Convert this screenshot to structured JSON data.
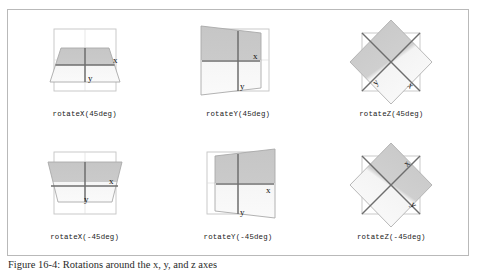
{
  "figure": {
    "caption": "Figure 16-4: Rotations around the x, y, and z axes",
    "frame_border_color": "#b9b9b9",
    "background_color": "#ffffff"
  },
  "colors": {
    "reference_outline": "#bfbfbf",
    "plane_outline": "#a8a8a8",
    "axis_line": "#6e6e6e",
    "plane_fill_dark": "#c9c9c9",
    "plane_fill_light": "#f2f2f2",
    "label_text": "#111111"
  },
  "axis_labels": {
    "x": "x",
    "y": "y"
  },
  "cells": [
    {
      "id": "rotateX-45",
      "label": "rotateX(45deg)",
      "transform_function": "rotateX",
      "angle": "45deg",
      "axis": "x",
      "direction": "positive"
    },
    {
      "id": "rotateY-45",
      "label": "rotateY(45deg)",
      "transform_function": "rotateY",
      "angle": "45deg",
      "axis": "y",
      "direction": "positive"
    },
    {
      "id": "rotateZ-45",
      "label": "rotateZ(45deg)",
      "transform_function": "rotateZ",
      "angle": "45deg",
      "axis": "z",
      "direction": "positive"
    },
    {
      "id": "rotateX-neg45",
      "label": "rotateX(-45deg)",
      "transform_function": "rotateX",
      "angle": "-45deg",
      "axis": "x",
      "direction": "negative"
    },
    {
      "id": "rotateY-neg45",
      "label": "rotateY(-45deg)",
      "transform_function": "rotateY",
      "angle": "-45deg",
      "axis": "y",
      "direction": "negative"
    },
    {
      "id": "rotateZ-neg45",
      "label": "rotateZ(-45deg)",
      "transform_function": "rotateZ",
      "angle": "-45deg",
      "axis": "z",
      "direction": "negative"
    }
  ]
}
